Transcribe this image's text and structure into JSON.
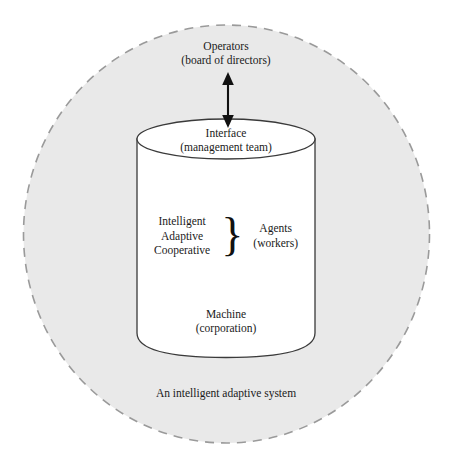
{
  "diagram": {
    "title": "An intelligent adaptive system",
    "colors": {
      "background": "#ffffff",
      "system_fill": "#e9e9e9",
      "system_border": "#9a9a9a",
      "machine_fill": "#ffffff",
      "machine_border": "#3a3a3a",
      "text": "#1a1a1a",
      "arrow": "#111111"
    },
    "system_boundary": {
      "name": "An intelligent adaptive system",
      "caption": "An intelligent adaptive system",
      "shape": "dashed-circle"
    },
    "operators": {
      "title": "Operators",
      "subtitle": "(board of directors)"
    },
    "connector": {
      "type": "double-headed-arrow",
      "orientation": "vertical"
    },
    "interface": {
      "title": "Interface",
      "subtitle": "(management team)"
    },
    "agents": {
      "attributes": [
        "Intelligent",
        "Adaptive",
        "Cooperative"
      ],
      "brace": "}",
      "title": "Agents",
      "subtitle": "(workers)"
    },
    "machine": {
      "title": "Machine",
      "subtitle": "(corporation)",
      "shape": "cylinder"
    }
  }
}
